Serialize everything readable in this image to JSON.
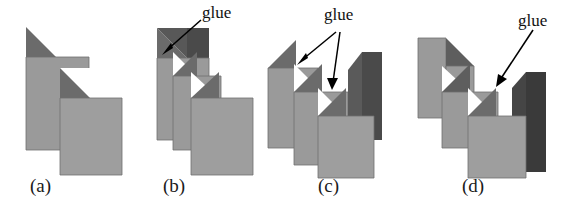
{
  "figure": {
    "caption_style": "lettered-panels",
    "background_color": "#ffffff",
    "panel_count": 4
  },
  "colors": {
    "sheet_face": "#9a9a9a",
    "sheet_face_alt": "#9e9e9e",
    "fold_shadow": "#6b6b6b",
    "back_panel_dark": "#3a3a3a",
    "outline": "#555555",
    "label_text": "#1a1a1a",
    "annotation_text": "#111111",
    "arrow": "#000000"
  },
  "panels": [
    {
      "id": "a",
      "label": "(a)",
      "sheet_count": 2,
      "annotations": []
    },
    {
      "id": "b",
      "label": "(b)",
      "sheet_count": 3,
      "annotations": [
        {
          "text": "glue",
          "arrow_count": 1
        }
      ]
    },
    {
      "id": "c",
      "label": "(c)",
      "sheet_count": 3,
      "annotations": [
        {
          "text": "glue",
          "arrow_count": 2
        }
      ]
    },
    {
      "id": "d",
      "label": "(d)",
      "sheet_count": 3,
      "annotations": [
        {
          "text": "glue",
          "arrow_count": 1
        }
      ]
    }
  ],
  "labels": {
    "panel_a": "(a)",
    "panel_b": "(b)",
    "panel_c": "(c)",
    "panel_d": "(d)",
    "glue_b": "glue",
    "glue_c": "glue",
    "glue_d": "glue"
  }
}
